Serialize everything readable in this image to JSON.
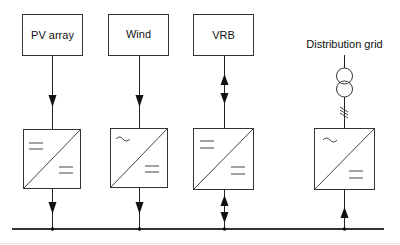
{
  "diagram": {
    "type": "single-line power system schematic",
    "sources": [
      {
        "id": "pv",
        "label": "PV array",
        "converter": "DC/DC",
        "flow": "to-bus"
      },
      {
        "id": "wind",
        "label": "Wind",
        "converter": "AC/DC",
        "flow": "to-bus"
      },
      {
        "id": "vrb",
        "label": "VRB",
        "converter": "DC/DC",
        "flow": "bidirectional"
      }
    ],
    "grid": {
      "id": "grid",
      "label": "Distribution grid",
      "symbol": "transformer-icon",
      "converter": "AC/DC",
      "flow": "from-bus"
    },
    "bus": {
      "label": ""
    },
    "symbols": {
      "dc": "=",
      "ac": "~"
    },
    "colors": {
      "line": "#222222",
      "background": "#ffffff"
    }
  }
}
